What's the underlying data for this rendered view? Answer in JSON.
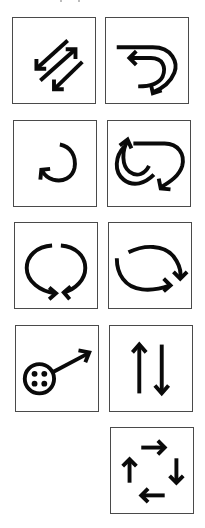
{
  "figure": {
    "stroke_color": "#0a0a0a",
    "frame_color": "#4a4a4a",
    "background": "#ffffff"
  },
  "tiles": [
    {
      "row": 1,
      "col": 1,
      "icon": "three-parallel-diagonal-arrows-icon",
      "meaning": "bidirectional diagonal exchange"
    },
    {
      "row": 1,
      "col": 2,
      "icon": "double-u-turn-arrows-icon",
      "meaning": "two curved return arrows"
    },
    {
      "row": 2,
      "col": 1,
      "icon": "clockwise-circular-arrow-icon",
      "meaning": "single circular turn arrow"
    },
    {
      "row": 2,
      "col": 2,
      "icon": "triple-loop-arrows-icon",
      "meaning": "nested loop arrows"
    },
    {
      "row": 3,
      "col": 1,
      "icon": "converging-loop-arrows-icon",
      "meaning": "two arcs meeting at bottom"
    },
    {
      "row": 3,
      "col": 2,
      "icon": "cycle-two-arc-arrows-icon",
      "meaning": "two arcs forming a cycle"
    },
    {
      "row": 4,
      "col": 1,
      "icon": "button-with-pointer-arrow-icon",
      "meaning": "four-dot circle with outward arrow"
    },
    {
      "row": 4,
      "col": 2,
      "icon": "up-down-arrows-icon",
      "meaning": "opposing vertical arrows"
    },
    {
      "row": 5,
      "col": 2,
      "icon": "four-arrow-cycle-icon",
      "meaning": "four straight arrows in a cycle"
    }
  ]
}
